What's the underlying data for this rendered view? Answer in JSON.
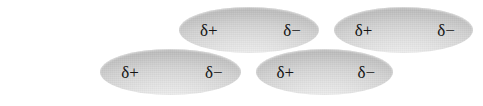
{
  "diagram": {
    "background_color": "#ffffff",
    "shape_fill_light": "#e4e4e4",
    "shape_fill_dark": "#9a9a9a",
    "label_color": "#141414",
    "molecules": [
      {
        "id": "top-left",
        "positive_label": "δ+",
        "negative_label": "δ−"
      },
      {
        "id": "top-right",
        "positive_label": "δ+",
        "negative_label": "δ−"
      },
      {
        "id": "bottom-left",
        "positive_label": "δ+",
        "negative_label": "δ−"
      },
      {
        "id": "bottom-right",
        "positive_label": "δ+",
        "negative_label": "δ−"
      }
    ]
  }
}
